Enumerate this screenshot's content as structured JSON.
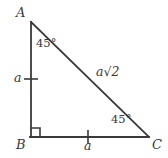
{
  "figure": {
    "type": "right-triangle-45-45-90",
    "background_color": "#ffffff",
    "stroke_color": "#3a3a3a",
    "vertices": {
      "A": {
        "label": "A",
        "x": 31,
        "y": 22
      },
      "B": {
        "label": "B",
        "x": 31,
        "y": 137
      },
      "C": {
        "label": "C",
        "x": 149,
        "y": 137
      }
    },
    "angles": [
      {
        "at": "A",
        "label": "45°",
        "value": 45
      },
      {
        "at": "C",
        "label": "45°",
        "value": 45
      },
      {
        "at": "B",
        "label": "",
        "value": 90,
        "marker": "right-angle-square"
      }
    ],
    "sides": [
      {
        "name": "AB",
        "label": "a",
        "tick_marks": 1
      },
      {
        "name": "BC",
        "label": "a",
        "tick_marks": 1
      },
      {
        "name": "AC",
        "label": "a√2",
        "label_base": "a",
        "label_radical": "√",
        "label_radicand": "2",
        "tick_marks": 0
      }
    ]
  }
}
